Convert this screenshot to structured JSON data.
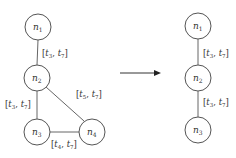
{
  "diagram": {
    "type": "graph-reduction",
    "colors": {
      "stroke": "#555555",
      "text": "#333333",
      "background": "#ffffff"
    },
    "left_graph": {
      "nodes": [
        {
          "id": "n1",
          "label": "n",
          "sub": "1",
          "cx": 38,
          "cy": 27
        },
        {
          "id": "n2",
          "label": "n",
          "sub": "2",
          "cx": 37,
          "cy": 78
        },
        {
          "id": "n3",
          "label": "n",
          "sub": "3",
          "cx": 37,
          "cy": 132
        },
        {
          "id": "n4",
          "label": "n",
          "sub": "4",
          "cx": 92,
          "cy": 132
        }
      ],
      "edges": [
        {
          "from": "n1",
          "to": "n2",
          "label": {
            "a": "t",
            "a_sub": "3",
            "b": "t",
            "b_sub": "7"
          }
        },
        {
          "from": "n2",
          "to": "n3",
          "label": {
            "a": "t",
            "a_sub": "3",
            "b": "t",
            "b_sub": "7"
          }
        },
        {
          "from": "n2",
          "to": "n4",
          "label": {
            "a": "t",
            "a_sub": "5",
            "b": "t",
            "b_sub": "7"
          }
        },
        {
          "from": "n3",
          "to": "n4",
          "label": {
            "a": "t",
            "a_sub": "4",
            "b": "t",
            "b_sub": "7"
          }
        }
      ]
    },
    "arrow": {
      "x1": 120,
      "x2": 160,
      "y": 73
    },
    "right_graph": {
      "nodes": [
        {
          "id": "n1",
          "label": "n",
          "sub": "1",
          "cx": 198,
          "cy": 26
        },
        {
          "id": "n2",
          "label": "n",
          "sub": "2",
          "cx": 198,
          "cy": 78
        },
        {
          "id": "n3",
          "label": "n",
          "sub": "3",
          "cx": 198,
          "cy": 130
        }
      ],
      "edges": [
        {
          "from": "n1",
          "to": "n2",
          "label": {
            "a": "t",
            "a_sub": "3",
            "b": "t",
            "b_sub": "7"
          }
        },
        {
          "from": "n2",
          "to": "n3",
          "label": {
            "a": "t",
            "a_sub": "3",
            "b": "t",
            "b_sub": "7"
          }
        }
      ]
    }
  }
}
